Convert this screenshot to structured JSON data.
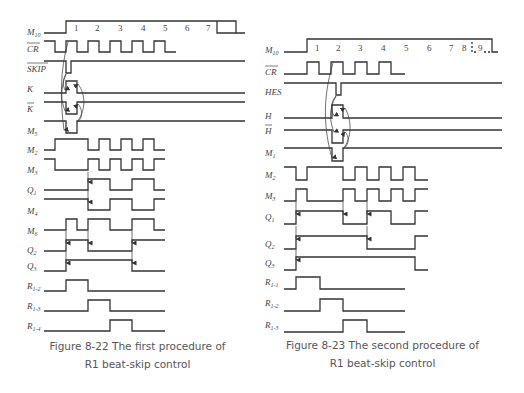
{
  "figures": [
    {
      "id": "fig-8-22",
      "caption_line1": "Figure 8-22   The first procedure of",
      "caption_line2": "R1 beat-skip control",
      "beat_numbers": [
        "1",
        "2",
        "3",
        "4",
        "5",
        "6",
        "7"
      ],
      "signals": [
        {
          "name": "M",
          "sub": "10",
          "bar": false
        },
        {
          "name": "CR",
          "sub": "",
          "bar": true
        },
        {
          "name": "SKIP",
          "sub": "",
          "bar": false
        },
        {
          "name": "K",
          "sub": "",
          "bar": false
        },
        {
          "name": "K",
          "sub": "",
          "bar": true
        },
        {
          "name": "M",
          "sub": "5",
          "bar": false
        },
        {
          "name": "M",
          "sub": "2",
          "bar": false
        },
        {
          "name": "M",
          "sub": "3",
          "bar": false
        },
        {
          "name": "Q",
          "sub": "1",
          "bar": false
        },
        {
          "name": "M",
          "sub": "4",
          "bar": false
        },
        {
          "name": "M",
          "sub": "6",
          "bar": false
        },
        {
          "name": "Q",
          "sub": "2",
          "bar": false
        },
        {
          "name": "Q",
          "sub": "3",
          "bar": false
        },
        {
          "name": "R",
          "sub": "1-2",
          "bar": false
        },
        {
          "name": "R",
          "sub": "1-3",
          "bar": false
        },
        {
          "name": "R",
          "sub": "1-4",
          "bar": false
        }
      ]
    },
    {
      "id": "fig-8-23",
      "caption_line1": "Figure 8-23   The second procedure of",
      "caption_line2": "R1 beat-skip control",
      "beat_numbers": [
        "1",
        "2",
        "3",
        "4",
        "5",
        "6",
        "7",
        "8",
        "9"
      ],
      "signals": [
        {
          "name": "M",
          "sub": "10",
          "bar": false
        },
        {
          "name": "CR",
          "sub": "",
          "bar": true
        },
        {
          "name": "HES",
          "sub": "",
          "bar": false
        },
        {
          "name": "H",
          "sub": "",
          "bar": false
        },
        {
          "name": "H",
          "sub": "",
          "bar": true
        },
        {
          "name": "M",
          "sub": "1",
          "bar": false
        },
        {
          "name": "M",
          "sub": "2",
          "bar": false
        },
        {
          "name": "M",
          "sub": "3",
          "bar": false
        },
        {
          "name": "Q",
          "sub": "1",
          "bar": false
        },
        {
          "name": "Q",
          "sub": "2",
          "bar": false
        },
        {
          "name": "Q",
          "sub": "3",
          "bar": false
        },
        {
          "name": "R",
          "sub": "1-1",
          "bar": false
        },
        {
          "name": "R",
          "sub": "1-2",
          "bar": false
        },
        {
          "name": "R",
          "sub": "1-3",
          "bar": false
        }
      ]
    }
  ]
}
